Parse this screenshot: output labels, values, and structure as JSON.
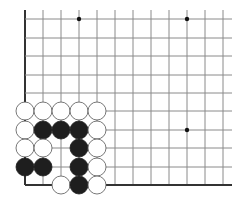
{
  "board": {
    "description": "Go problem diagram - lower-left corner",
    "grid": {
      "x_lines": [
        25,
        43,
        61,
        79,
        97,
        115,
        133,
        151,
        169,
        187,
        205,
        223
      ],
      "y_lines": [
        19,
        38,
        56,
        75,
        93,
        111,
        130,
        148,
        167,
        185
      ],
      "right_extent": 232,
      "top_extent": 10,
      "line_color": "#8a8a8a",
      "edge_color": "#333333"
    },
    "star_points": [
      {
        "x": 79,
        "y": 19
      },
      {
        "x": 187,
        "y": 19
      },
      {
        "x": 187,
        "y": 130
      }
    ],
    "stone_radius": 9,
    "stones": [
      {
        "color": "white",
        "x": 25,
        "y": 111
      },
      {
        "color": "white",
        "x": 43,
        "y": 111
      },
      {
        "color": "white",
        "x": 61,
        "y": 111
      },
      {
        "color": "white",
        "x": 79,
        "y": 111
      },
      {
        "color": "white",
        "x": 97,
        "y": 111
      },
      {
        "color": "white",
        "x": 25,
        "y": 130
      },
      {
        "color": "black",
        "x": 43,
        "y": 130
      },
      {
        "color": "black",
        "x": 61,
        "y": 130
      },
      {
        "color": "black",
        "x": 79,
        "y": 130
      },
      {
        "color": "white",
        "x": 97,
        "y": 130
      },
      {
        "color": "white",
        "x": 25,
        "y": 148
      },
      {
        "color": "white",
        "x": 43,
        "y": 148
      },
      {
        "color": "black",
        "x": 79,
        "y": 148
      },
      {
        "color": "white",
        "x": 97,
        "y": 148
      },
      {
        "color": "black",
        "x": 25,
        "y": 167
      },
      {
        "color": "black",
        "x": 43,
        "y": 167
      },
      {
        "color": "black",
        "x": 79,
        "y": 167
      },
      {
        "color": "white",
        "x": 97,
        "y": 167
      },
      {
        "color": "white",
        "x": 61,
        "y": 185
      },
      {
        "color": "black",
        "x": 79,
        "y": 185
      },
      {
        "color": "white",
        "x": 97,
        "y": 185
      }
    ],
    "colors": {
      "black_stone": "#1e1e1e",
      "white_stone": "#ffffff",
      "white_stone_outline": "#555555",
      "star_point": "#111111"
    }
  }
}
